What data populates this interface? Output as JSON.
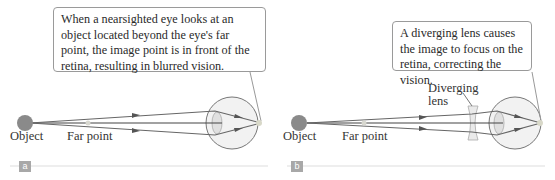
{
  "panels": [
    {
      "id": "a",
      "tag": "a",
      "callout": "When a nearsighted eye looks at an object located beyond the eye's far point, the image point is in front of the retina, resulting in blurred vision.",
      "labels": {
        "object": "Object",
        "far_point": "Far point"
      }
    },
    {
      "id": "b",
      "tag": "b",
      "callout": "A diverging lens causes the image to focus on the retina, correcting the vision.",
      "labels": {
        "object": "Object",
        "far_point": "Far point",
        "lens": "Diverging lens"
      }
    }
  ],
  "colors": {
    "object": "#8a8a8a",
    "ray": "#6a6a6a",
    "eye_fill": "#f2f2f2",
    "eye_stroke": "#777777",
    "lens_fill": "#e6e6e6",
    "focus_point": "#d8d8c8",
    "tag_bg": "#a8a8a8",
    "baseline": "#dddddd"
  }
}
